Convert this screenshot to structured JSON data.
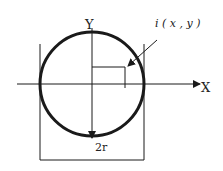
{
  "diagram": {
    "labels": {
      "y_axis": "Y",
      "x_axis": "X",
      "point": "i ( x , y )",
      "diameter": "2r"
    },
    "colors": {
      "stroke": "#1a1a1a",
      "background": "#ffffff"
    }
  }
}
